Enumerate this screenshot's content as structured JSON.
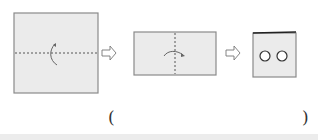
{
  "diagram": {
    "steps": [
      {
        "name": "square-paper",
        "fold": "horizontal-valley-fold",
        "arrow": "fold-up-arrow"
      },
      {
        "name": "folded-rectangle",
        "fold": "vertical-valley-fold",
        "arrow": "fold-right-arrow"
      },
      {
        "name": "folded-card-with-two-holes",
        "holes": 2
      }
    ],
    "transition_arrows": [
      "hollow-right-arrow",
      "hollow-right-arrow"
    ],
    "answer_blank": {
      "open": "(",
      "close": ")"
    },
    "colors": {
      "paper": "#ebebeb",
      "edge": "#8a8a8a",
      "fold_line": "#555555"
    }
  }
}
